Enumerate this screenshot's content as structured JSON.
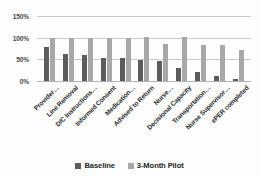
{
  "chart_data": {
    "type": "bar",
    "title": "",
    "xlabel": "",
    "ylabel": "",
    "ylim": [
      0,
      150
    ],
    "ytick_labels": [
      "150%",
      "100%",
      "50%",
      "0%"
    ],
    "ytick_values": [
      150,
      100,
      50,
      0
    ],
    "grid": true,
    "legend_position": "bottom",
    "categories": [
      "Provider…",
      "Line Removal",
      "D/C Instructions…",
      "Informed Consent",
      "Medication…",
      "Advised to Return",
      "Nurse…",
      "Decisional Capacity",
      "Transportation…",
      "Nurse Supervisor…",
      "ePER completed"
    ],
    "series": [
      {
        "name": "Baseline",
        "color": "#5c5c5c",
        "values": [
          78,
          62,
          59,
          54,
          52,
          49,
          46,
          29,
          21,
          12,
          4
        ]
      },
      {
        "name": "3-Month Pilot",
        "color": "#a8a8a8",
        "values": [
          100,
          100,
          100,
          100,
          100,
          101,
          85,
          101,
          84,
          83,
          72
        ]
      }
    ]
  },
  "legend": {
    "items": [
      {
        "label": "Baseline",
        "color": "#5c5c5c"
      },
      {
        "label": "3-Month Pilot",
        "color": "#a8a8a8"
      }
    ]
  }
}
